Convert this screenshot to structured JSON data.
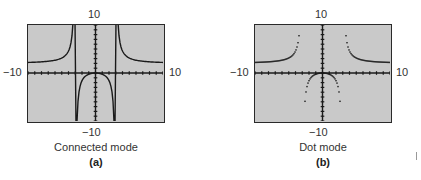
{
  "chart_data": [
    {
      "type": "line",
      "title": "Connected mode",
      "subtitle": "(a)",
      "function": "y = 2x^2/(x^2 - 9)",
      "mode": "connected",
      "xlim": [
        -10,
        10
      ],
      "ylim": [
        -10,
        10
      ],
      "tick_labels": {
        "ymax": "10",
        "ymin": "−10",
        "xmin": "−10",
        "xmax": "10"
      },
      "tick_spacing": 1,
      "vertical_asymptotes": [
        -3,
        3
      ],
      "horizontal_asymptote": 2,
      "grid": false,
      "sample_points": [
        {
          "x": -10,
          "y": 2.2
        },
        {
          "x": -6,
          "y": 2.67
        },
        {
          "x": -4,
          "y": 4.57
        },
        {
          "x": -3.3,
          "y": 11.5
        },
        {
          "x": -2.9,
          "y": -28.6
        },
        {
          "x": -2,
          "y": -1.6
        },
        {
          "x": -1,
          "y": -0.25
        },
        {
          "x": 0,
          "y": 0
        },
        {
          "x": 1,
          "y": -0.25
        },
        {
          "x": 2,
          "y": -1.6
        },
        {
          "x": 2.9,
          "y": -28.6
        },
        {
          "x": 3.3,
          "y": 11.5
        },
        {
          "x": 4,
          "y": 4.57
        },
        {
          "x": 6,
          "y": 2.67
        },
        {
          "x": 10,
          "y": 2.2
        }
      ]
    },
    {
      "type": "scatter",
      "title": "Dot mode",
      "subtitle": "(b)",
      "function": "y = 2x^2/(x^2 - 9)",
      "mode": "dot",
      "xlim": [
        -10,
        10
      ],
      "ylim": [
        -10,
        10
      ],
      "tick_labels": {
        "ymax": "10",
        "ymin": "−10",
        "xmin": "−10",
        "xmax": "10"
      },
      "tick_spacing": 1,
      "grid": false
    }
  ],
  "panels": [
    {
      "caption": "Connected mode",
      "letter": "(a)",
      "ymax_label": "10",
      "ymin_label": "−10",
      "xmin_label": "−10",
      "xmax_label": "10"
    },
    {
      "caption": "Dot mode",
      "letter": "(b)",
      "ymax_label": "10",
      "ymin_label": "−10",
      "xmin_label": "−10",
      "xmax_label": "10"
    }
  ],
  "style": {
    "screen_bg": "#c9c9c9",
    "curve": "#1a1a1a",
    "frame": "#2a2a2a"
  }
}
